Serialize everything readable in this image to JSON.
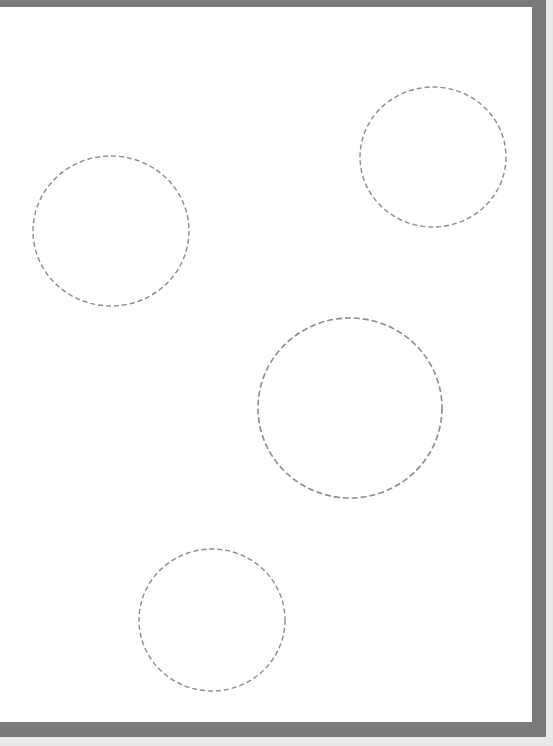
{
  "canvas": {
    "background": "#ffffff",
    "frame_color": "#7a7a7a",
    "outer_background": "#e9e9e9"
  },
  "shapes": [
    {
      "type": "ellipse",
      "cx": 111,
      "cy": 231,
      "rx": 78,
      "ry": 75,
      "stroke": "#8a8a8a",
      "dash": "5 3"
    },
    {
      "type": "ellipse",
      "cx": 433,
      "cy": 157,
      "rx": 73,
      "ry": 70,
      "stroke": "#8a8a8a",
      "dash": "5 3"
    },
    {
      "type": "ellipse",
      "cx": 350,
      "cy": 408,
      "rx": 92,
      "ry": 90,
      "stroke": "#8a8a8a",
      "dash": "6 3"
    },
    {
      "type": "ellipse",
      "cx": 212,
      "cy": 620,
      "rx": 73,
      "ry": 71,
      "stroke": "#8a8a8a",
      "dash": "5 3"
    }
  ]
}
